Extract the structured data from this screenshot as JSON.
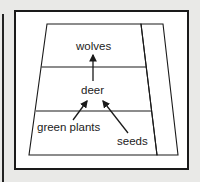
{
  "diagram": {
    "type": "food-pyramid",
    "levels": [
      {
        "label": "wolves"
      },
      {
        "label": "deer"
      },
      {
        "labels": [
          "green plants",
          "seeds"
        ]
      }
    ],
    "labels": {
      "top": "wolves",
      "middle": "deer",
      "bottom_left": "green plants",
      "bottom_right": "seeds"
    },
    "arrows": [
      {
        "from": "deer",
        "to": "wolves"
      },
      {
        "from": "green plants",
        "to": "deer"
      },
      {
        "from": "seeds",
        "to": "deer"
      }
    ],
    "colors": {
      "background": "#e9e9e7",
      "line": "#1a1a1a",
      "panel": "#ffffff"
    }
  }
}
